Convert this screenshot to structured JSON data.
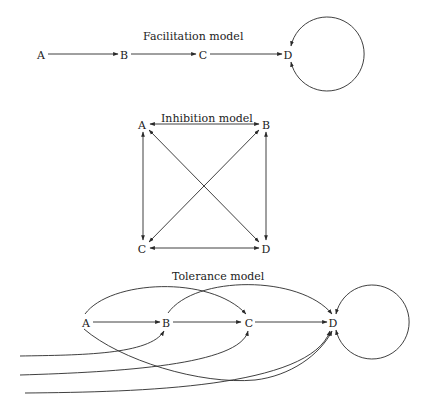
{
  "facilitation": {
    "title": "Facilitation model",
    "nodes": [
      "A",
      "B",
      "C",
      "D"
    ]
  },
  "inhibition": {
    "title": "Inhibition model",
    "nodes": [
      "A",
      "B",
      "C",
      "D"
    ]
  },
  "tolerance": {
    "title": "Tolerance model",
    "nodes": [
      "A",
      "B",
      "C",
      "D"
    ]
  },
  "colors": {
    "line": "#2a2a2a",
    "background": "#ffffff"
  }
}
